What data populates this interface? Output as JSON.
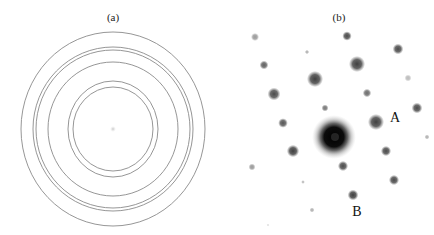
{
  "figure": {
    "panels": [
      {
        "id": "a",
        "label": "(a)",
        "label_pos": [
          113,
          12
        ],
        "description": "Ring diffraction pattern",
        "center": [
          113,
          129
        ],
        "center_spot_color": "#d6d6d6",
        "ring_color": "#8a8a8a",
        "rings": [
          {
            "rx": 92,
            "ry": 97
          },
          {
            "rx": 80,
            "ry": 82
          },
          {
            "rx": 77,
            "ry": 79
          },
          {
            "rx": 65,
            "ry": 67
          },
          {
            "rx": 45,
            "ry": 48
          },
          {
            "rx": 40,
            "ry": 42
          }
        ]
      },
      {
        "id": "b",
        "label": "(b)",
        "label_pos": [
          339,
          12
        ],
        "description": "Spot diffraction pattern",
        "center": [
          334,
          137
        ],
        "spots": [
          {
            "x": 255,
            "y": 37,
            "r": 3.0,
            "o": 0.45
          },
          {
            "x": 347,
            "y": 36,
            "r": 3.5,
            "o": 0.8
          },
          {
            "x": 307,
            "y": 52,
            "r": 1.6,
            "o": 0.35
          },
          {
            "x": 398,
            "y": 49,
            "r": 4.0,
            "o": 0.8
          },
          {
            "x": 264,
            "y": 65,
            "r": 3.3,
            "o": 0.7
          },
          {
            "x": 357,
            "y": 64,
            "r": 6.0,
            "o": 0.85
          },
          {
            "x": 408,
            "y": 78,
            "r": 2.6,
            "o": 0.3
          },
          {
            "x": 315,
            "y": 79,
            "r": 6.0,
            "o": 0.85
          },
          {
            "x": 274,
            "y": 94,
            "r": 4.8,
            "o": 0.8
          },
          {
            "x": 367,
            "y": 93,
            "r": 3.2,
            "o": 0.65
          },
          {
            "x": 417,
            "y": 108,
            "r": 4.0,
            "o": 0.8
          },
          {
            "x": 325,
            "y": 108,
            "r": 2.6,
            "o": 0.6
          },
          {
            "x": 283,
            "y": 123,
            "r": 3.6,
            "o": 0.75
          },
          {
            "x": 376,
            "y": 122,
            "r": 6.0,
            "o": 0.85
          },
          {
            "x": 427,
            "y": 137,
            "r": 1.8,
            "o": 0.35
          },
          {
            "x": 293,
            "y": 151,
            "r": 4.6,
            "o": 0.85
          },
          {
            "x": 386,
            "y": 151,
            "r": 3.8,
            "o": 0.8
          },
          {
            "x": 252,
            "y": 167,
            "r": 2.6,
            "o": 0.45
          },
          {
            "x": 343,
            "y": 166,
            "r": 3.8,
            "o": 0.8
          },
          {
            "x": 303,
            "y": 182,
            "r": 1.4,
            "o": 0.3
          },
          {
            "x": 394,
            "y": 180,
            "r": 3.8,
            "o": 0.8
          },
          {
            "x": 353,
            "y": 195,
            "r": 4.0,
            "o": 0.85
          },
          {
            "x": 312,
            "y": 210,
            "r": 1.8,
            "o": 0.35
          },
          {
            "x": 268,
            "y": 225,
            "r": 1.2,
            "o": 0.12
          }
        ],
        "annotations": [
          {
            "text": "A",
            "x": 395,
            "y": 118
          },
          {
            "text": "B",
            "x": 357,
            "y": 212
          }
        ]
      }
    ]
  }
}
